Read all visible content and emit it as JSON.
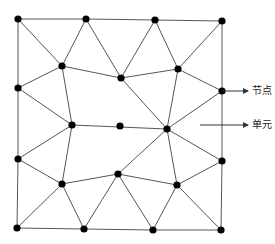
{
  "diagram": {
    "type": "triangular-mesh",
    "line_color": "#555555",
    "node_color": "#000000",
    "nodes": [
      {
        "id": 0,
        "x": 18,
        "y": 19
      },
      {
        "id": 1,
        "x": 86,
        "y": 19
      },
      {
        "id": 2,
        "x": 155,
        "y": 20
      },
      {
        "id": 3,
        "x": 222,
        "y": 21
      },
      {
        "id": 4,
        "x": 62,
        "y": 66
      },
      {
        "id": 5,
        "x": 121,
        "y": 78
      },
      {
        "id": 6,
        "x": 178,
        "y": 69
      },
      {
        "id": 7,
        "x": 222,
        "y": 91
      },
      {
        "id": 8,
        "x": 18,
        "y": 88
      },
      {
        "id": 9,
        "x": 72,
        "y": 125
      },
      {
        "id": 10,
        "x": 120,
        "y": 126
      },
      {
        "id": 11,
        "x": 167,
        "y": 129
      },
      {
        "id": 12,
        "x": 222,
        "y": 161
      },
      {
        "id": 13,
        "x": 18,
        "y": 159
      },
      {
        "id": 14,
        "x": 62,
        "y": 184
      },
      {
        "id": 15,
        "x": 118,
        "y": 174
      },
      {
        "id": 16,
        "x": 177,
        "y": 185
      },
      {
        "id": 17,
        "x": 17,
        "y": 228
      },
      {
        "id": 18,
        "x": 84,
        "y": 229
      },
      {
        "id": 19,
        "x": 153,
        "y": 230
      },
      {
        "id": 20,
        "x": 221,
        "y": 230
      }
    ],
    "edges": [
      [
        0,
        1
      ],
      [
        1,
        2
      ],
      [
        2,
        3
      ],
      [
        3,
        7
      ],
      [
        7,
        12
      ],
      [
        12,
        20
      ],
      [
        20,
        19
      ],
      [
        19,
        18
      ],
      [
        18,
        17
      ],
      [
        17,
        13
      ],
      [
        13,
        8
      ],
      [
        8,
        0
      ],
      [
        0,
        4
      ],
      [
        1,
        4
      ],
      [
        1,
        5
      ],
      [
        2,
        5
      ],
      [
        2,
        6
      ],
      [
        3,
        6
      ],
      [
        6,
        7
      ],
      [
        4,
        5
      ],
      [
        4,
        8
      ],
      [
        4,
        9
      ],
      [
        5,
        6
      ],
      [
        5,
        11
      ],
      [
        6,
        11
      ],
      [
        7,
        11
      ],
      [
        8,
        9
      ],
      [
        9,
        11
      ],
      [
        9,
        13
      ],
      [
        9,
        14
      ],
      [
        11,
        12
      ],
      [
        11,
        15
      ],
      [
        11,
        16
      ],
      [
        13,
        14
      ],
      [
        14,
        15
      ],
      [
        14,
        17
      ],
      [
        14,
        18
      ],
      [
        15,
        16
      ],
      [
        15,
        18
      ],
      [
        15,
        19
      ],
      [
        12,
        16
      ],
      [
        16,
        19
      ],
      [
        16,
        20
      ]
    ],
    "annotations": [
      {
        "text": "节点",
        "arrow_from": [
          222,
          91
        ],
        "arrow_to": [
          248,
          91
        ],
        "label_x": 252,
        "label_y": 85,
        "target": "node"
      },
      {
        "text": "单元",
        "arrow_from": [
          200,
          125
        ],
        "arrow_to": [
          248,
          125
        ],
        "label_x": 252,
        "label_y": 119,
        "target": "element"
      }
    ]
  }
}
